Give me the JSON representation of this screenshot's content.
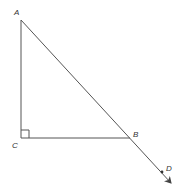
{
  "diagram": {
    "type": "geometry",
    "points": {
      "A": {
        "label": "A",
        "x": 21,
        "y": 20
      },
      "B": {
        "label": "B",
        "x": 130,
        "y": 138
      },
      "C": {
        "label": "C",
        "x": 21,
        "y": 138
      },
      "D": {
        "label": "D",
        "x": 162,
        "y": 172
      }
    },
    "segments": [
      {
        "from": "A",
        "to": "C"
      },
      {
        "from": "C",
        "to": "B"
      },
      {
        "from": "A",
        "to": "D",
        "style": "ray",
        "arrow": "end"
      }
    ],
    "right_angle_at": "C",
    "colors": {
      "line": "#555555",
      "label": "#333333",
      "background": "#ffffff"
    }
  }
}
